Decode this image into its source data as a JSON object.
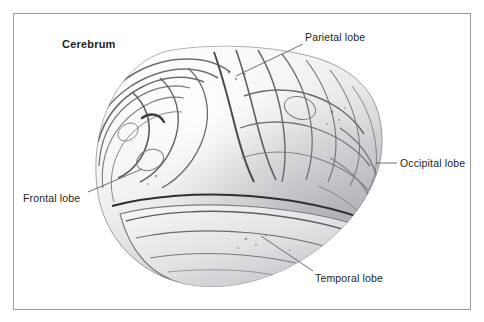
{
  "figure": {
    "title": "Cerebrum",
    "frame_color": "#9a9a9a",
    "background_color": "#ffffff",
    "text_color": "#231f20"
  },
  "labels": {
    "cerebrum": "Cerebrum",
    "parietal": "Parietal lobe",
    "occipital": "Occipital lobe",
    "frontal": "Frontal lobe",
    "temporal": "Temporal lobe"
  },
  "leader_lines": [
    {
      "name": "parietal-leader",
      "x1": 303,
      "y1": 44,
      "x2": 236,
      "y2": 76
    },
    {
      "name": "occipital-leader",
      "x1": 397,
      "y1": 163,
      "x2": 376,
      "y2": 163
    },
    {
      "name": "frontal-leader",
      "x1": 88,
      "y1": 192,
      "x2": 142,
      "y2": 169
    },
    {
      "name": "temporal-leader",
      "x1": 313,
      "y1": 271,
      "x2": 261,
      "y2": 236
    }
  ],
  "palette": {
    "cortex_light": "#f4f4f5",
    "cortex_mid": "#d9d9dc",
    "cortex_shadow": "#a9a9ae",
    "sulcus_line": "#6e6e74",
    "sulcus_deep": "#3a3a3e",
    "outline": "#8d8d93"
  }
}
